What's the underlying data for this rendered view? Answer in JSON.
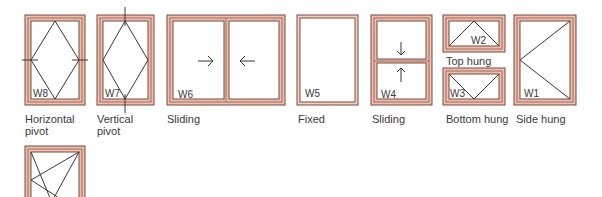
{
  "diagram": {
    "colors": {
      "frame_fill": "#e8b8a8",
      "frame_line": "#7a4a3a",
      "sash_line": "#4a3a3a",
      "text": "#3a3a3a"
    },
    "windows": [
      {
        "id": "W8",
        "label": "Horizontal pivot",
        "label_lines": [
          "Horizontal",
          "pivot"
        ]
      },
      {
        "id": "W7",
        "label": "Vertical pivot",
        "label_lines": [
          "Vertical",
          "pivot"
        ]
      },
      {
        "id": "W6",
        "label": "Sliding",
        "arrows": [
          "→",
          "←"
        ]
      },
      {
        "id": "W5",
        "label": "Fixed"
      },
      {
        "id": "W4",
        "label": "Sliding",
        "arrows": [
          "↓",
          "↑"
        ]
      },
      {
        "id": "W2",
        "label": "Top hung"
      },
      {
        "id": "W3",
        "label": "Bottom hung"
      },
      {
        "id": "W1",
        "label": "Side hung"
      },
      {
        "id": "W9",
        "label": "",
        "partial": true
      }
    ]
  }
}
